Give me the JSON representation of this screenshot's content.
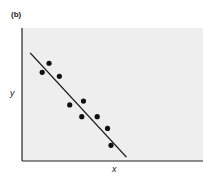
{
  "chart_data": {
    "type": "scatter",
    "title": "(b)",
    "xlabel": "x",
    "ylabel": "y",
    "grid": false,
    "legend": null,
    "xlim": [
      0,
      10
    ],
    "ylim": [
      0,
      10
    ],
    "series": [
      {
        "name": "observations",
        "x": [
          1.0,
          1.4,
          2.0,
          2.6,
          3.4,
          3.3,
          4.2,
          4.8,
          5.0
        ],
        "y": [
          6.8,
          7.5,
          6.5,
          4.3,
          4.6,
          3.4,
          3.4,
          2.5,
          1.2
        ]
      }
    ],
    "fit_line": {
      "x": [
        0.3,
        5.9
      ],
      "y": [
        8.3,
        0.3
      ],
      "slope": "negative"
    },
    "colors": {
      "points": "#111111",
      "line": "#111111",
      "plot_bg": "#eeeeee",
      "axes": "#222222"
    }
  }
}
